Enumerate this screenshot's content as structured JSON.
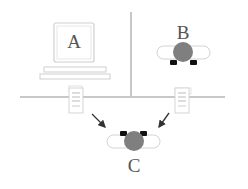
{
  "diagram": {
    "nodes": {
      "a": {
        "label": "A",
        "kind": "desktop-computer"
      },
      "b": {
        "label": "B",
        "kind": "robot"
      },
      "c": {
        "label": "C",
        "kind": "robot"
      }
    },
    "colors": {
      "robot_body": "#7f7f7f",
      "robot_wheel": "#111111",
      "wall": "#c8c8c8",
      "outline": "#cfcfcf",
      "arrow": "#333333"
    },
    "edges": [
      {
        "from": "left-document",
        "to": "c"
      },
      {
        "from": "right-document",
        "to": "c"
      }
    ]
  }
}
